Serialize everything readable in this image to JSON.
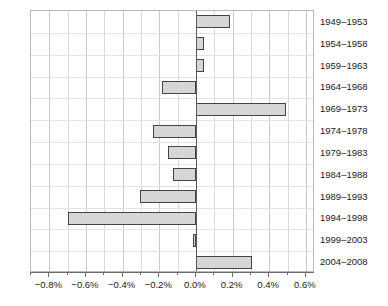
{
  "chart_data": {
    "type": "bar",
    "orientation": "horizontal",
    "title": "",
    "xlabel": "",
    "ylabel": "",
    "categories": [
      "1949–1953",
      "1954–1958",
      "1959–1963",
      "1964–1968",
      "1969–1973",
      "1974–1978",
      "1979–1983",
      "1984–1988",
      "1989–1993",
      "1994–1998",
      "1999–2003",
      "2004–2008"
    ],
    "values": [
      0.185,
      0.045,
      0.045,
      -0.185,
      0.49,
      -0.235,
      -0.15,
      -0.125,
      -0.305,
      -0.7,
      -0.015,
      0.305
    ],
    "unit": "%",
    "xlim": [
      -0.9,
      0.65
    ],
    "xticks": [
      -0.8,
      -0.6,
      -0.4,
      -0.2,
      0.0,
      0.2,
      0.4,
      0.6
    ],
    "xticklabels": [
      "−0.8%",
      "−0.6%",
      "−0.4%",
      "−0.2%",
      "0.0%",
      "0.2%",
      "0.4%",
      "0.6%"
    ],
    "xticks_minor": [
      -0.9,
      -0.7,
      -0.5,
      -0.3,
      -0.1,
      0.1,
      0.3,
      0.5
    ],
    "grid": true,
    "legend": null,
    "bar_fill_color": "#d6d6d6",
    "bar_border_color": "#444444",
    "gridline_color": "#d9d9d9",
    "zero_line_color": "#5a5a5a",
    "axis_color": "#6b6b6b",
    "text_color": "#1a1a1a"
  }
}
